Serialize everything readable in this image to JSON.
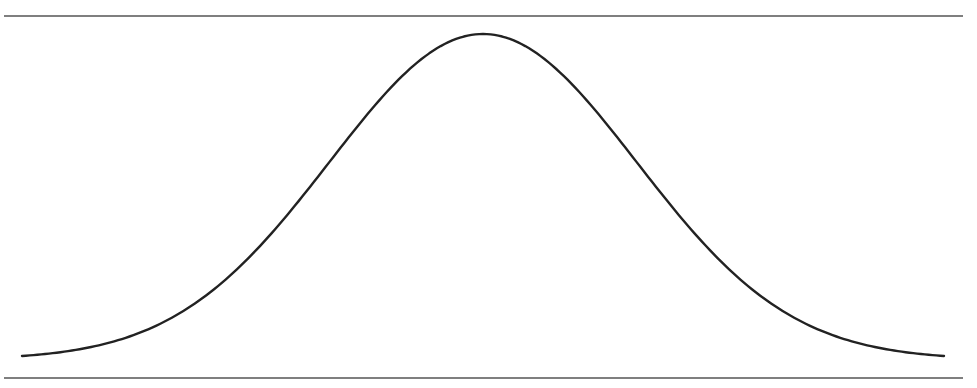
{
  "chart_data": {
    "type": "line",
    "title": "",
    "xlabel": "",
    "ylabel": "",
    "grid": false,
    "legend": null,
    "distribution": {
      "kind": "normal",
      "mean": 0,
      "std": 1
    },
    "x": [
      -3.0,
      -2.5,
      -2.0,
      -1.5,
      -1.0,
      -0.5,
      0.0,
      0.5,
      1.0,
      1.5,
      2.0,
      2.5,
      3.0
    ],
    "series": [
      {
        "name": "density",
        "values": [
          0.0044,
          0.0175,
          0.054,
          0.1295,
          0.242,
          0.3521,
          0.3989,
          0.3521,
          0.242,
          0.1295,
          0.054,
          0.0175,
          0.0044
        ]
      }
    ],
    "xlim": [
      -3.0,
      3.0
    ],
    "ylim": [
      0,
      0.42
    ]
  },
  "style": {
    "line_color": "#222222",
    "rule_color": "#555555",
    "background": "#ffffff"
  }
}
